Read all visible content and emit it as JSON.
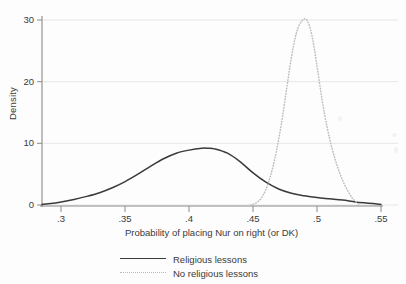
{
  "chart_data": {
    "type": "line",
    "title": "",
    "xlabel": "Probability of placing Nur on right (or DK)",
    "ylabel": "Density",
    "xlim": [
      0.285,
      0.55
    ],
    "ylim": [
      0,
      30
    ],
    "xticks": [
      0.3,
      0.35,
      0.4,
      0.45,
      0.5,
      0.55
    ],
    "xtick_labels": [
      ".3",
      ".35",
      ".4",
      ".45",
      ".5",
      ".55"
    ],
    "yticks": [
      0,
      10,
      20,
      30
    ],
    "ytick_labels": [
      "0",
      "10",
      "20",
      "30"
    ],
    "grid": "horizontal",
    "legend_position": "bottom",
    "series": [
      {
        "name": "Religious lessons",
        "style": "solid",
        "color": "#3a3a3a",
        "x": [
          0.285,
          0.29,
          0.3,
          0.31,
          0.32,
          0.33,
          0.34,
          0.35,
          0.36,
          0.37,
          0.38,
          0.39,
          0.4,
          0.41,
          0.415,
          0.42,
          0.43,
          0.44,
          0.45,
          0.46,
          0.47,
          0.48,
          0.49,
          0.5,
          0.51,
          0.52,
          0.53,
          0.54,
          0.55
        ],
        "values": [
          0.1,
          0.2,
          0.5,
          0.9,
          1.4,
          2.0,
          2.8,
          3.8,
          5.0,
          6.3,
          7.5,
          8.4,
          8.9,
          9.2,
          9.2,
          9.1,
          8.4,
          7.0,
          5.2,
          3.7,
          2.6,
          1.9,
          1.5,
          1.2,
          1.0,
          0.8,
          0.5,
          0.3,
          0.1
        ]
      },
      {
        "name": "No religious lessons",
        "style": "dotted",
        "color": "#bdbdbd",
        "x": [
          0.448,
          0.452,
          0.456,
          0.46,
          0.464,
          0.468,
          0.472,
          0.476,
          0.48,
          0.484,
          0.488,
          0.492,
          0.496,
          0.5,
          0.504,
          0.508,
          0.512,
          0.516,
          0.52,
          0.524,
          0.528,
          0.533
        ],
        "values": [
          0.0,
          0.3,
          1.0,
          2.5,
          5.0,
          8.5,
          13.0,
          18.5,
          24.0,
          28.0,
          29.8,
          30.0,
          27.5,
          22.5,
          17.0,
          12.5,
          9.0,
          6.2,
          4.0,
          2.3,
          1.0,
          0.1
        ]
      }
    ],
    "annotations": []
  },
  "axes": {
    "ylabel": "Density",
    "xlabel": "Probability of placing Nur on right (or DK)",
    "ytick_labels": [
      "30",
      "20",
      "10",
      "0"
    ],
    "xtick_labels": [
      ".3",
      ".35",
      ".4",
      ".45",
      ".5",
      ".55"
    ]
  },
  "legend": {
    "items": [
      {
        "label": "Religious lessons",
        "style": "solid"
      },
      {
        "label": "No religious lessons",
        "style": "dotted"
      }
    ]
  },
  "colors": {
    "solid_series": "#3a3a3a",
    "dotted_series": "#bdbdbd",
    "gridline": "#e6e6e6",
    "axis": "#8a8a8a",
    "background": "#fdfdfd"
  }
}
